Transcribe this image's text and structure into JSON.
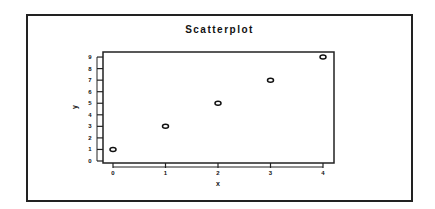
{
  "chart_data": {
    "type": "scatter",
    "title": "Scatterplot",
    "xlabel": "x",
    "ylabel": "y",
    "x": [
      0,
      1,
      2,
      3,
      4
    ],
    "y": [
      1,
      3,
      5,
      7,
      9
    ],
    "xticks": [
      0,
      1,
      2,
      3,
      4
    ],
    "yticks": [
      0,
      1,
      2,
      3,
      4,
      5,
      6,
      7,
      8,
      9
    ],
    "xlim": [
      -0.2,
      4.2
    ],
    "ylim": [
      0,
      9.4
    ],
    "grid": false,
    "legend": null,
    "marker": "open-ellipse",
    "color": "#111111"
  }
}
